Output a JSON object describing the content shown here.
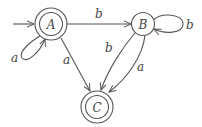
{
  "diagram": {
    "type": "finite-automaton",
    "colors": {
      "stroke": "#555555",
      "text": "#444444",
      "background": "#ffffff"
    },
    "start_state": "A",
    "nodes": [
      {
        "id": "A",
        "label": "A",
        "accepting": true
      },
      {
        "id": "B",
        "label": "B",
        "accepting": false
      },
      {
        "id": "C",
        "label": "C",
        "accepting": true
      }
    ],
    "edges": [
      {
        "from": "A",
        "to": "A",
        "label": "a"
      },
      {
        "from": "A",
        "to": "B",
        "label": "b"
      },
      {
        "from": "A",
        "to": "C",
        "label": "a"
      },
      {
        "from": "B",
        "to": "B",
        "label": "b"
      },
      {
        "from": "B",
        "to": "C",
        "label": "b"
      },
      {
        "from": "B",
        "to": "C",
        "label": "a"
      }
    ]
  }
}
